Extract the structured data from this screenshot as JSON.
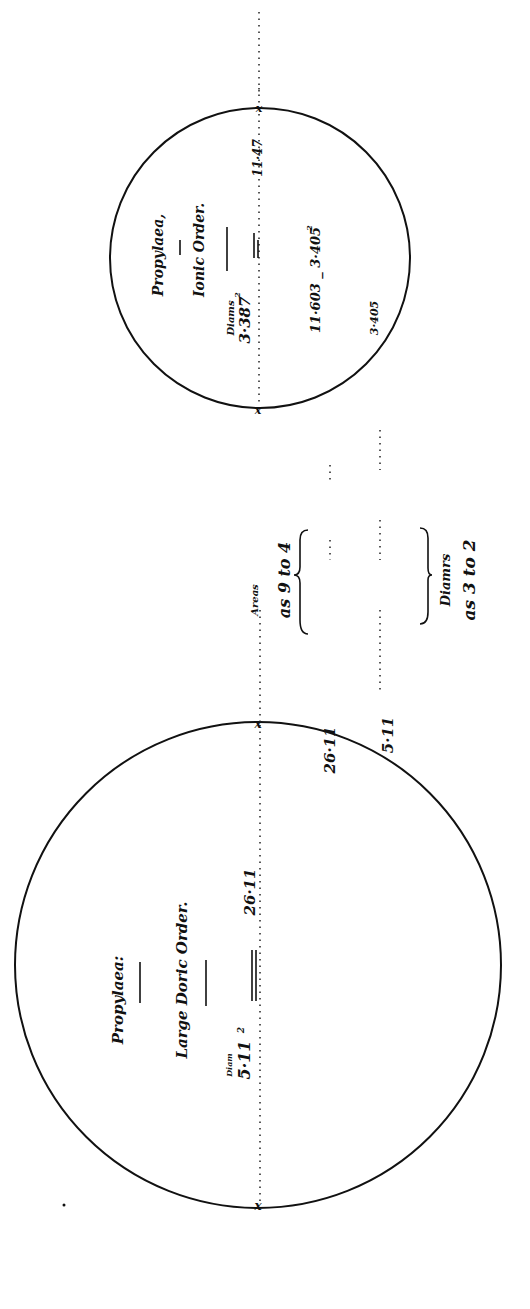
{
  "diagram": {
    "orientation": "rotated -90deg (text reads bottom-to-top)",
    "left_circle": {
      "title": "Propylaea:",
      "subtitle": "Large Doric Order.",
      "diam_label": "Diam",
      "diam_value": "5·11",
      "diam_exponent": "2",
      "ratio_value": "26·11",
      "inner_value_1": "26·11",
      "inner_value_2": "5·11"
    },
    "middle": {
      "areas_label": "Areas",
      "areas_ratio": "as 9 to 4",
      "diam_label": "Diamrs",
      "diam_ratio": "as 3 to 2"
    },
    "right_circle": {
      "title": "Propylaea,",
      "subtitle": "Ionic Order.",
      "diam_label": "Diams",
      "diam_value": "3·387",
      "diam_exponent": "2",
      "ratio_value": "11·47",
      "formula": "11·603 _ 3·405",
      "formula_exponent": "2",
      "inner_value": "3·405"
    },
    "colors": {
      "ink": "#111111",
      "paper": "#ffffff"
    }
  }
}
